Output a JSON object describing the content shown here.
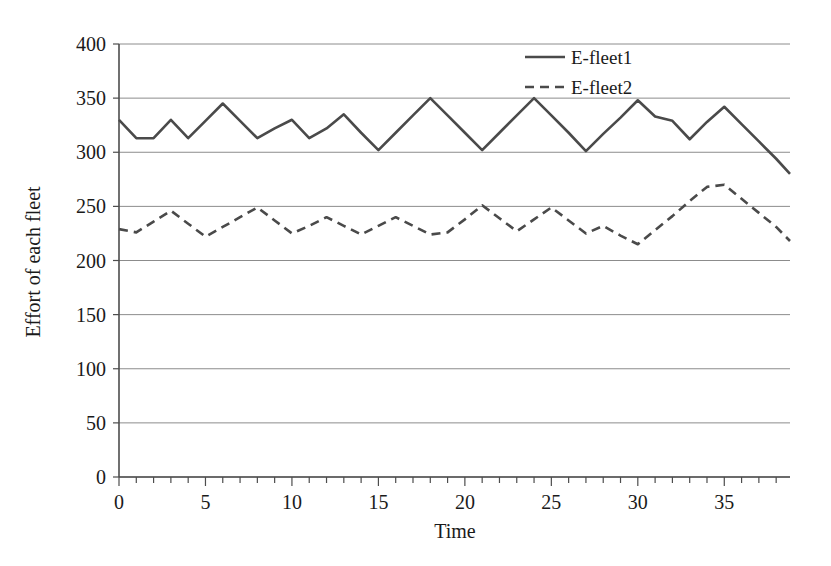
{
  "chart_data": {
    "type": "line",
    "title": "",
    "xlabel": "Time",
    "ylabel": "Effort of each fleet",
    "xlim": [
      0,
      38.8
    ],
    "ylim": [
      0,
      400
    ],
    "grid": true,
    "legend_position": "top-right",
    "xticks": [
      0,
      5,
      10,
      15,
      20,
      25,
      30,
      35
    ],
    "xtick_labels": [
      "0",
      "5",
      "10",
      "15",
      "20",
      "25",
      "30",
      "35"
    ],
    "xminor_step": 1,
    "yticks": [
      0,
      50,
      100,
      150,
      200,
      250,
      300,
      350,
      400
    ],
    "ytick_labels": [
      "0",
      "50",
      "100",
      "150",
      "200",
      "250",
      "300",
      "350",
      "400"
    ],
    "x": [
      0,
      1,
      2,
      3,
      4,
      5,
      6,
      7,
      8,
      9,
      10,
      11,
      12,
      13,
      14,
      15,
      16,
      17,
      18,
      19,
      20,
      21,
      22,
      23,
      24,
      25,
      26,
      27,
      28,
      29,
      30,
      31,
      32,
      33,
      34,
      35,
      36,
      37,
      38,
      38.8
    ],
    "series": [
      {
        "name": "E-fleet1",
        "style": "solid",
        "color": "#4a4a4a",
        "values": [
          330,
          313,
          313,
          330,
          313,
          329,
          345,
          329,
          313,
          322,
          330,
          313,
          322,
          335,
          318,
          302,
          318,
          334,
          350,
          334,
          318,
          302,
          318,
          334,
          350,
          334,
          318,
          301,
          317,
          332,
          348,
          333,
          329,
          312,
          328,
          342,
          326,
          310,
          294,
          280
        ]
      },
      {
        "name": "E-fleet2",
        "style": "dashed",
        "color": "#4a4a4a",
        "values": [
          229,
          226,
          236,
          246,
          234,
          222,
          231,
          240,
          249,
          237,
          225,
          232,
          240,
          232,
          224,
          232,
          240,
          232,
          224,
          226,
          238,
          251,
          239,
          227,
          238,
          249,
          237,
          225,
          232,
          223,
          215,
          228,
          241,
          255,
          268,
          270,
          257,
          244,
          231,
          218
        ]
      }
    ]
  },
  "legend": {
    "items": [
      {
        "label": "E-fleet1",
        "style": "solid"
      },
      {
        "label": "E-fleet2",
        "style": "dashed"
      }
    ]
  }
}
